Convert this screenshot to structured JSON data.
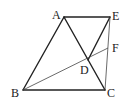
{
  "diagram": {
    "type": "geometry",
    "points": {
      "A": {
        "label": "A",
        "x": 64,
        "y": 17
      },
      "E": {
        "label": "E",
        "x": 110,
        "y": 17
      },
      "B": {
        "label": "B",
        "x": 23,
        "y": 90
      },
      "C": {
        "label": "C",
        "x": 105,
        "y": 90
      },
      "D": {
        "label": "D",
        "x": 88,
        "y": 60
      },
      "F": {
        "label": "F",
        "x": 108,
        "y": 48
      }
    },
    "segments": [
      "AE",
      "AB",
      "BC",
      "AC",
      "ED",
      "EC",
      "BF"
    ],
    "colors": {
      "line": "#222222",
      "thin_line": "#555555",
      "background": "#ffffff"
    }
  }
}
